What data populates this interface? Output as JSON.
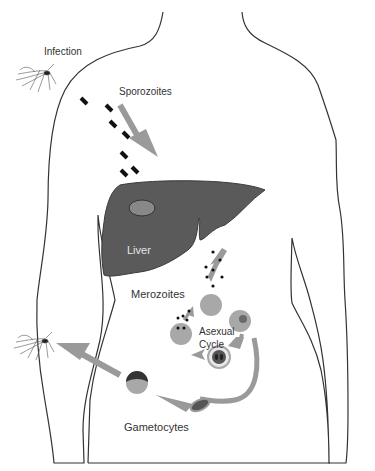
{
  "diagram": {
    "labels": {
      "infection": "Infection",
      "sporozoites": "Sporozoites",
      "liver": "Liver",
      "merozoites": "Merozoites",
      "asexual_line1": "Asexual",
      "asexual_line2": "Cycle",
      "gametocytes": "Gametocytes"
    },
    "colors": {
      "outline": "#333333",
      "liver": "#5a5a5a",
      "liver_lesion": "#888888",
      "arrow": "#9a9a9a",
      "cell": "#a8a8a8",
      "parasite_dark": "#3a3a3a",
      "text": "#333333",
      "liver_text": "#e6e6e6"
    },
    "stages": [
      "Infection",
      "Sporozoites",
      "Liver",
      "Merozoites",
      "Asexual Cycle",
      "Gametocytes"
    ]
  }
}
